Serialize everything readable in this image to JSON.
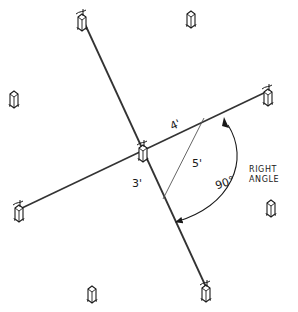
{
  "diagram": {
    "type": "layout-sketch",
    "colors": {
      "ink": "#1a1a1a",
      "string": "#333333",
      "background": "#ffffff"
    },
    "posts": [
      {
        "id": "top-left",
        "x": 82,
        "y": 20,
        "connected": true,
        "stake": true
      },
      {
        "id": "top-center",
        "x": 191,
        "y": 19,
        "connected": false,
        "stake": false
      },
      {
        "id": "mid-left",
        "x": 14,
        "y": 99,
        "connected": false,
        "stake": false
      },
      {
        "id": "mid-right",
        "x": 268,
        "y": 96,
        "connected": true,
        "stake": true
      },
      {
        "id": "center",
        "x": 143,
        "y": 152,
        "connected": true,
        "stake": true
      },
      {
        "id": "lower-left",
        "x": 19,
        "y": 212,
        "connected": true,
        "stake": true
      },
      {
        "id": "lower-right",
        "x": 271,
        "y": 208,
        "connected": false,
        "stake": false
      },
      {
        "id": "bottom-left",
        "x": 92,
        "y": 294,
        "connected": false,
        "stake": false
      },
      {
        "id": "bottom-right",
        "x": 206,
        "y": 292,
        "connected": true,
        "stake": true
      }
    ],
    "strings": [
      {
        "id": "line-a",
        "from": [
          84,
          22
        ],
        "to": [
          206,
          287
        ]
      },
      {
        "id": "line-b",
        "from": [
          22,
          208
        ],
        "to": [
          266,
          92
        ]
      }
    ],
    "hypotenuse": {
      "from": [
        204,
        118
      ],
      "to": [
        163,
        199
      ]
    },
    "labels": {
      "side_a": "4'",
      "side_b": "3'",
      "hypotenuse": "5'",
      "angle": "90°",
      "note_line1": "RIGHT",
      "note_line2": "ANGLE"
    }
  }
}
